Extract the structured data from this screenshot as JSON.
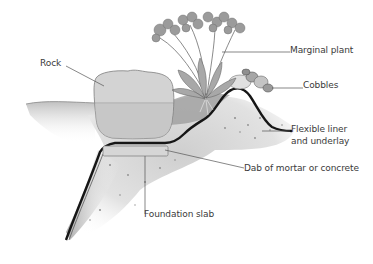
{
  "diagram": {
    "type": "cross-section illustration",
    "labels": [
      {
        "id": "rock",
        "text": "Rock"
      },
      {
        "id": "marginal_plant",
        "text": "Marginal plant"
      },
      {
        "id": "cobbles",
        "text": "Cobbles"
      },
      {
        "id": "flexible_liner",
        "text": "Flexible liner"
      },
      {
        "id": "underlay",
        "text": "and underlay"
      },
      {
        "id": "mortar",
        "text": "Dab of mortar or concrete"
      },
      {
        "id": "foundation",
        "text": "Foundation slab"
      }
    ],
    "colors": {
      "background": "#ffffff",
      "label_text": "#3a3a3a",
      "leader_line": "#555555",
      "liner": "#1a1a1a",
      "rock": "#d4d4d4",
      "soil": "#bdbdbd",
      "water": "#c8c8c8"
    }
  }
}
